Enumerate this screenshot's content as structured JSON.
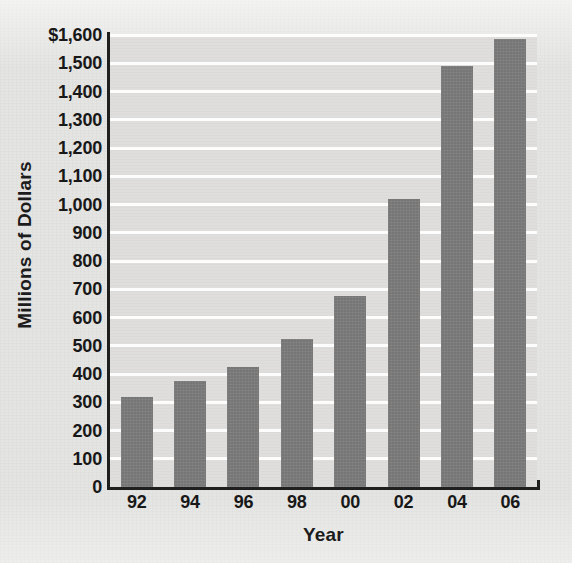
{
  "chart_data": {
    "type": "bar",
    "title": "",
    "subtitle": "",
    "xlabel": "Year",
    "ylabel": "Millions of Dollars",
    "categories": [
      "92",
      "94",
      "96",
      "98",
      "00",
      "02",
      "04",
      "06"
    ],
    "values": [
      320,
      375,
      425,
      525,
      675,
      1020,
      1490,
      1585
    ],
    "series": [
      {
        "name": "Millions of Dollars",
        "values": [
          320,
          375,
          425,
          525,
          675,
          1020,
          1490,
          1585
        ]
      }
    ],
    "ylim": [
      0,
      1600
    ],
    "ytick_values": [
      0,
      100,
      200,
      300,
      400,
      500,
      600,
      700,
      800,
      900,
      1000,
      1100,
      1200,
      1300,
      1400,
      1500,
      1600
    ],
    "ytick_labels": [
      "0",
      "100",
      "200",
      "300",
      "400",
      "500",
      "600",
      "700",
      "800",
      "900",
      "1,000",
      "1,100",
      "1,200",
      "1,300",
      "1,400",
      "1,500",
      "$1,600"
    ],
    "xtick_labels": [
      "92",
      "94",
      "96",
      "98",
      "00",
      "02",
      "04",
      "06"
    ],
    "grid": true,
    "grid_axis": "y",
    "grid_color": "#ffffff",
    "legend": false,
    "legend_position": "none",
    "bar_color": "#7b7b7b",
    "plot_background": "#dedddb",
    "figure_background": "#e3e3e1",
    "axis_color": "#1f1f1f",
    "text_color": "#181818"
  }
}
